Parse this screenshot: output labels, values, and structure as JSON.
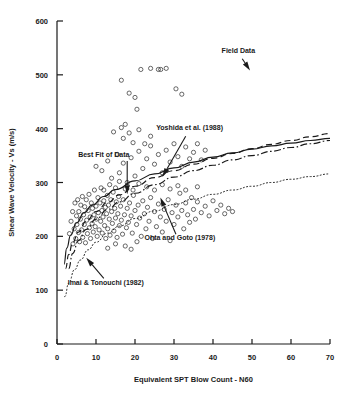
{
  "figure": {
    "name": "shear-wave-velocity-vs-spt-blow-count",
    "background": "#ffffff",
    "ink": "#1a1a1a"
  },
  "chart_data": {
    "type": "scatter",
    "title": "",
    "xlabel": "Equivalent  SPT Blow Count - N60",
    "ylabel": "Shear Wave Velocity - Vs (m/s)",
    "xlim": [
      0,
      70
    ],
    "ylim": [
      0,
      600
    ],
    "xticks": [
      0,
      10,
      20,
      30,
      40,
      50,
      60,
      70
    ],
    "yticks": [
      0,
      100,
      200,
      300,
      400,
      500,
      600
    ],
    "xticklabels": [
      "0",
      "10",
      "20",
      "30",
      "40",
      "50",
      "60",
      "70"
    ],
    "yticklabels": [
      "0",
      "100",
      "200",
      "300",
      "400",
      "500",
      "600"
    ],
    "grid": false,
    "legend": "none (curves labelled by leader-line annotations)",
    "marker": "open-circle",
    "series": [
      {
        "name": "Field Data",
        "type": "scatter",
        "marker": "open-circle",
        "points": [
          [
            3.2,
            205
          ],
          [
            3.6,
            228
          ],
          [
            4.0,
            246
          ],
          [
            4.1,
            186
          ],
          [
            4.4,
            214
          ],
          [
            4.6,
            262
          ],
          [
            4.8,
            196
          ],
          [
            5.0,
            238
          ],
          [
            5.1,
            222
          ],
          [
            5.3,
            268
          ],
          [
            5.5,
            207
          ],
          [
            5.6,
            246
          ],
          [
            5.8,
            190
          ],
          [
            6.0,
            232
          ],
          [
            6.1,
            258
          ],
          [
            6.3,
            212
          ],
          [
            6.5,
            274
          ],
          [
            6.6,
            198
          ],
          [
            6.8,
            240
          ],
          [
            7.0,
            222
          ],
          [
            7.1,
            255
          ],
          [
            7.3,
            188
          ],
          [
            7.5,
            268
          ],
          [
            7.6,
            230
          ],
          [
            7.8,
            205
          ],
          [
            8.0,
            248
          ],
          [
            8.2,
            278
          ],
          [
            8.3,
            216
          ],
          [
            8.5,
            236
          ],
          [
            8.6,
            196
          ],
          [
            8.8,
            262
          ],
          [
            9.0,
            224
          ],
          [
            9.1,
            252
          ],
          [
            9.3,
            208
          ],
          [
            9.5,
            240
          ],
          [
            9.6,
            286
          ],
          [
            9.8,
            218
          ],
          [
            10.0,
            256
          ],
          [
            10.1,
            232
          ],
          [
            10.3,
            200
          ],
          [
            10.5,
            272
          ],
          [
            10.6,
            244
          ],
          [
            10.8,
            212
          ],
          [
            11.0,
            262
          ],
          [
            11.2,
            228
          ],
          [
            11.3,
            290
          ],
          [
            11.5,
            248
          ],
          [
            11.6,
            206
          ],
          [
            11.8,
            236
          ],
          [
            12.0,
            266
          ],
          [
            12.2,
            220
          ],
          [
            12.4,
            254
          ],
          [
            12.5,
            196
          ],
          [
            12.7,
            242
          ],
          [
            12.9,
            276
          ],
          [
            13.0,
            214
          ],
          [
            13.2,
            258
          ],
          [
            13.4,
            232
          ],
          [
            13.6,
            202
          ],
          [
            13.8,
            268
          ],
          [
            14.0,
            246
          ],
          [
            14.2,
            224
          ],
          [
            14.4,
            282
          ],
          [
            14.6,
            210
          ],
          [
            14.8,
            252
          ],
          [
            15.0,
            234
          ],
          [
            15.2,
            264
          ],
          [
            15.4,
            198
          ],
          [
            15.6,
            242
          ],
          [
            15.8,
            274
          ],
          [
            16.0,
            220
          ],
          [
            16.3,
            256
          ],
          [
            16.5,
            230
          ],
          [
            16.8,
            204
          ],
          [
            17.0,
            268
          ],
          [
            17.3,
            240
          ],
          [
            17.5,
            288
          ],
          [
            17.8,
            216
          ],
          [
            18.0,
            252
          ],
          [
            18.3,
            226
          ],
          [
            18.6,
            262
          ],
          [
            19.0,
            238
          ],
          [
            19.3,
            206
          ],
          [
            19.6,
            276
          ],
          [
            20.0,
            248
          ],
          [
            20.4,
            222
          ],
          [
            20.8,
            258
          ],
          [
            21.2,
            234
          ],
          [
            21.6,
            200
          ],
          [
            22.0,
            266
          ],
          [
            22.4,
            242
          ],
          [
            22.8,
            214
          ],
          [
            23.2,
            254
          ],
          [
            23.6,
            228
          ],
          [
            24.0,
            272
          ],
          [
            24.5,
            196
          ],
          [
            25.0,
            246
          ],
          [
            25.5,
            218
          ],
          [
            26.0,
            260
          ],
          [
            26.5,
            236
          ],
          [
            27.0,
            208
          ],
          [
            27.5,
            250
          ],
          [
            28.0,
            228
          ],
          [
            28.5,
            268
          ],
          [
            29.0,
            192
          ],
          [
            29.5,
            244
          ],
          [
            30.0,
            222
          ],
          [
            30.5,
            258
          ],
          [
            31.0,
            236
          ],
          [
            31.5,
            280
          ],
          [
            32.0,
            248
          ],
          [
            32.5,
            214
          ],
          [
            33.0,
            262
          ],
          [
            33.5,
            240
          ],
          [
            34.0,
            226
          ],
          [
            34.5,
            272
          ],
          [
            35.0,
            250
          ],
          [
            35.5,
            232
          ],
          [
            36.0,
            264
          ],
          [
            37.0,
            244
          ],
          [
            38.0,
            256
          ],
          [
            39.0,
            238
          ],
          [
            40.0,
            266
          ],
          [
            41.0,
            248
          ],
          [
            42.0,
            258
          ],
          [
            43.0,
            242
          ],
          [
            44.0,
            252
          ],
          [
            45.0,
            246
          ],
          [
            10.0,
            330
          ],
          [
            11.5,
            322
          ],
          [
            13.0,
            340
          ],
          [
            14.0,
            308
          ],
          [
            15.5,
            352
          ],
          [
            16.0,
            318
          ],
          [
            17.0,
            336
          ],
          [
            18.0,
            300
          ],
          [
            19.0,
            346
          ],
          [
            20.0,
            312
          ],
          [
            21.0,
            358
          ],
          [
            22.0,
            326
          ],
          [
            23.0,
            344
          ],
          [
            24.0,
            368
          ],
          [
            25.0,
            334
          ],
          [
            26.0,
            352
          ],
          [
            27.0,
            318
          ],
          [
            28.0,
            360
          ],
          [
            29.0,
            338
          ],
          [
            30.0,
            372
          ],
          [
            31.0,
            348
          ],
          [
            32.0,
            330
          ],
          [
            33.0,
            366
          ],
          [
            34.0,
            344
          ],
          [
            35.0,
            356
          ],
          [
            36.0,
            372
          ],
          [
            37.0,
            342
          ],
          [
            38.0,
            360
          ],
          [
            14.5,
            394
          ],
          [
            16.5,
            402
          ],
          [
            17.0,
            382
          ],
          [
            17.5,
            408
          ],
          [
            18.5,
            392
          ],
          [
            19.5,
            374
          ],
          [
            21.0,
            398
          ],
          [
            22.5,
            372
          ],
          [
            24.0,
            386
          ],
          [
            16.5,
            490
          ],
          [
            18.5,
            466
          ],
          [
            20.0,
            458
          ],
          [
            20.5,
            436
          ],
          [
            21.5,
            510
          ],
          [
            24.0,
            512
          ],
          [
            26.0,
            510
          ],
          [
            26.6,
            510
          ],
          [
            28.0,
            512
          ],
          [
            30.5,
            474
          ],
          [
            32.0,
            464
          ],
          [
            12.0,
            286
          ],
          [
            13.5,
            296
          ],
          [
            15.0,
            290
          ],
          [
            16.0,
            302
          ],
          [
            18.0,
            294
          ],
          [
            19.5,
            286
          ],
          [
            21.0,
            298
          ],
          [
            23.0,
            292
          ],
          [
            25.0,
            286
          ],
          [
            27.0,
            296
          ],
          [
            29.0,
            288
          ],
          [
            31.0,
            294
          ],
          [
            33.0,
            286
          ],
          [
            36.0,
            292
          ],
          [
            19.0,
            176
          ],
          [
            20.5,
            190
          ],
          [
            17.5,
            182
          ],
          [
            15.0,
            186
          ],
          [
            13.0,
            178
          ]
        ]
      },
      {
        "name": "Best Fit of Data",
        "type": "line",
        "style": "solid",
        "points": [
          [
            1.8,
            148
          ],
          [
            2.5,
            178
          ],
          [
            3.5,
            202
          ],
          [
            5.0,
            225
          ],
          [
            7.0,
            244
          ],
          [
            9.0,
            258
          ],
          [
            12.0,
            274
          ],
          [
            15.0,
            287
          ],
          [
            20.0,
            303
          ],
          [
            25.0,
            316
          ],
          [
            30.0,
            327
          ],
          [
            35.0,
            338
          ],
          [
            40.0,
            347
          ],
          [
            45.0,
            355
          ],
          [
            50.0,
            362
          ],
          [
            55.0,
            368
          ],
          [
            60.0,
            373
          ],
          [
            65.0,
            378
          ],
          [
            70.0,
            382
          ]
        ]
      },
      {
        "name": "Yoshida et al. (1988)",
        "type": "line",
        "style": "dashed",
        "points": [
          [
            2.2,
            140
          ],
          [
            3.0,
            166
          ],
          [
            4.0,
            188
          ],
          [
            5.5,
            208
          ],
          [
            7.5,
            228
          ],
          [
            10.0,
            246
          ],
          [
            13.0,
            263
          ],
          [
            16.0,
            277
          ],
          [
            20.0,
            293
          ],
          [
            25.0,
            309
          ],
          [
            30.0,
            322
          ],
          [
            35.0,
            334
          ],
          [
            40.0,
            345
          ],
          [
            45.0,
            354
          ],
          [
            50.0,
            363
          ],
          [
            55.0,
            371
          ],
          [
            60.0,
            378
          ],
          [
            65.0,
            385
          ],
          [
            70.0,
            391
          ]
        ]
      },
      {
        "name": "Ohta and Goto (1978)",
        "type": "line",
        "style": "dash-dot",
        "points": [
          [
            3.0,
            140
          ],
          [
            4.0,
            168
          ],
          [
            5.5,
            192
          ],
          [
            7.5,
            213
          ],
          [
            10.0,
            232
          ],
          [
            13.0,
            250
          ],
          [
            16.0,
            264
          ],
          [
            20.0,
            280
          ],
          [
            25.0,
            296
          ],
          [
            30.0,
            310
          ],
          [
            35.0,
            322
          ],
          [
            40.0,
            332
          ],
          [
            45.0,
            342
          ],
          [
            50.0,
            350
          ],
          [
            55.0,
            358
          ],
          [
            60.0,
            365
          ],
          [
            65.0,
            372
          ],
          [
            70.0,
            378
          ]
        ]
      },
      {
        "name": "Imai & Tonouchi (1982)",
        "type": "line",
        "style": "dotted",
        "points": [
          [
            2.0,
            88
          ],
          [
            3.0,
            113
          ],
          [
            4.5,
            138
          ],
          [
            6.0,
            156
          ],
          [
            8.0,
            175
          ],
          [
            10.0,
            189
          ],
          [
            13.0,
            206
          ],
          [
            16.0,
            219
          ],
          [
            20.0,
            233
          ],
          [
            25.0,
            247
          ],
          [
            30.0,
            259
          ],
          [
            35.0,
            269
          ],
          [
            40.0,
            278
          ],
          [
            45.0,
            286
          ],
          [
            50.0,
            293
          ],
          [
            55.0,
            300
          ],
          [
            60.0,
            306
          ],
          [
            65.0,
            311
          ],
          [
            70.0,
            316
          ]
        ]
      }
    ],
    "annotations": [
      {
        "name": "field-data",
        "label": "Field Data",
        "text_xy": [
          46.5,
          540
        ],
        "arrow_from": [
          47.5,
          530
        ],
        "arrow_to": [
          49.5,
          508
        ]
      },
      {
        "name": "yoshida-1988",
        "label": "Yoshida et al. (1988)",
        "text_xy": [
          34.0,
          398
        ],
        "arrow_from": [
          33.0,
          386
        ],
        "arrow_to": [
          27.0,
          310
        ]
      },
      {
        "name": "best-fit-of-data",
        "label": "Best Fit of Data",
        "text_xy": [
          12.0,
          348
        ],
        "arrow_from": [
          18.0,
          340
        ],
        "arrow_to": [
          18.0,
          278
        ]
      },
      {
        "name": "ohta-goto-1978",
        "label": "Ohta and Goto (1978)",
        "text_xy": [
          31.5,
          193
        ],
        "arrow_from": [
          30.5,
          204
        ],
        "arrow_to": [
          26.5,
          272
        ]
      },
      {
        "name": "imai-tonouchi-1982",
        "label": "Imai & Tonouchi (1982)",
        "text_xy": [
          12.5,
          110
        ],
        "arrow_from": [
          12.0,
          122
        ],
        "arrow_to": [
          7.5,
          160
        ]
      }
    ]
  }
}
